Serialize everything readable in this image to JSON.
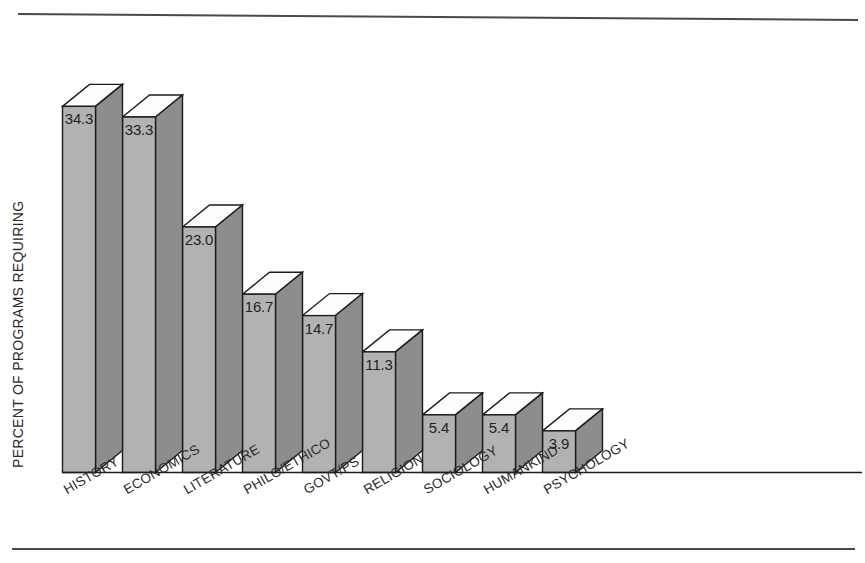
{
  "chart_data": {
    "type": "bar",
    "title": "",
    "subtitle": "",
    "xlabel": "",
    "ylabel": "PERCENT OF PROGRAMS REQUIRING",
    "ylim": [
      0,
      40
    ],
    "grid": false,
    "legend": false,
    "value_label_format": "one-decimal",
    "style": "3d-extruded-bars",
    "categories": [
      "HISTORY",
      "ECONOMICS",
      "LITERATURE",
      "PHILO/ETHICO",
      "GOVT/PS",
      "RELIGION",
      "SOCIOLOGY",
      "HUMANKIND",
      "PSYCHOLOGY"
    ],
    "values": [
      34.3,
      33.3,
      23.0,
      16.7,
      14.7,
      11.3,
      5.4,
      5.4,
      3.9
    ],
    "value_labels": [
      "34.3",
      "33.3",
      "23.0",
      "16.7",
      "14.7",
      "11.3",
      "5.4",
      "5.4",
      "3.9"
    ]
  },
  "figure": {
    "top_rule": true,
    "bottom_rule": true,
    "background_color": "#ffffff",
    "bar_front_color": "#b2b2b2",
    "bar_side_color": "#8d8d8d",
    "bar_top_color": "#fdfdfd",
    "outline_color": "#1c1c1c",
    "rule_color": "#4a4a4a"
  },
  "axis": {
    "y_title": "PERCENT OF PROGRAMS REQUIRING",
    "category_label_rotation_deg": -30
  }
}
